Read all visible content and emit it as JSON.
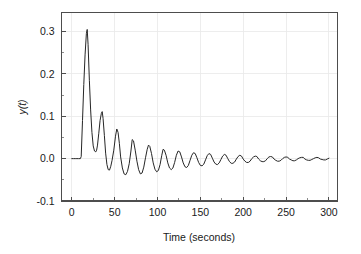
{
  "chart_data": {
    "type": "line",
    "title": "",
    "xlabel": "Time (seconds)",
    "ylabel": "y(t)",
    "xlim": [
      -12,
      310
    ],
    "ylim": [
      -0.1,
      0.345
    ],
    "xticks": [
      0,
      50,
      100,
      150,
      200,
      250,
      300
    ],
    "xtick_labels": [
      "0",
      "50",
      "100",
      "150",
      "200",
      "250",
      "300"
    ],
    "xminor_ticks": [
      25,
      75,
      125,
      175,
      225,
      275
    ],
    "yticks": [
      -0.1,
      0.0,
      0.1,
      0.2,
      0.3
    ],
    "ytick_labels": [
      "-0.1",
      "0.0",
      "0.1",
      "0.2",
      "0.3"
    ],
    "yminor_ticks": [
      -0.05,
      0.05,
      0.15,
      0.25
    ],
    "grid": true,
    "grid_color": "#e9e9e9",
    "line_color": "#262626",
    "legend": null,
    "series": [
      {
        "name": "y(t)",
        "x": [
          0,
          2,
          4,
          6,
          8,
          10,
          11,
          12.5,
          14,
          15.5,
          17,
          18,
          19,
          20.5,
          22,
          23.5,
          25,
          26.5,
          28,
          29,
          30,
          31.5,
          33,
          34.5,
          35.5,
          36.5,
          38,
          39.5,
          41,
          42.5,
          44,
          45.5,
          47,
          49,
          51,
          52.5,
          54,
          55.5,
          57,
          59,
          61,
          63,
          65,
          67,
          69,
          70.5,
          72,
          74,
          76,
          78,
          80,
          82,
          84,
          86,
          88,
          89.5,
          91,
          93,
          95,
          97,
          99,
          101,
          103,
          105,
          106.5,
          108,
          110,
          112,
          114,
          116,
          118,
          120,
          122,
          124,
          126,
          128,
          130,
          132,
          134,
          136,
          138,
          140,
          142,
          144,
          146,
          148,
          150,
          152,
          154,
          156,
          158,
          160,
          162,
          164,
          166,
          168,
          170,
          172,
          174,
          176,
          178,
          180,
          182,
          184,
          186,
          188,
          190,
          192,
          194,
          196,
          198,
          200,
          202,
          204,
          206,
          208,
          210,
          212,
          214,
          216,
          218,
          220,
          222,
          224,
          226,
          228,
          230,
          232,
          234,
          236,
          238,
          240,
          242,
          244,
          246,
          248,
          250,
          252,
          254,
          256,
          258,
          260,
          262,
          264,
          266,
          268,
          270,
          272,
          274,
          276,
          278,
          280,
          282,
          284,
          286,
          288,
          290,
          292,
          294,
          296,
          298,
          300
        ],
        "y": [
          0,
          0,
          0,
          0,
          0,
          0,
          0.005,
          0.09,
          0.175,
          0.245,
          0.295,
          0.305,
          0.27,
          0.185,
          0.115,
          0.062,
          0.03,
          0.018,
          0.016,
          0.02,
          0.032,
          0.06,
          0.09,
          0.107,
          0.111,
          0.095,
          0.055,
          0.013,
          -0.014,
          -0.026,
          -0.027,
          -0.018,
          -0.004,
          0.02,
          0.053,
          0.07,
          0.062,
          0.036,
          0.004,
          -0.022,
          -0.036,
          -0.038,
          -0.03,
          -0.012,
          0.018,
          0.045,
          0.042,
          0.02,
          -0.006,
          -0.026,
          -0.036,
          -0.034,
          -0.02,
          0.002,
          0.022,
          0.032,
          0.029,
          0.012,
          -0.01,
          -0.025,
          -0.031,
          -0.028,
          -0.014,
          0.008,
          0.022,
          0.02,
          0.008,
          -0.01,
          -0.022,
          -0.026,
          -0.022,
          -0.009,
          0.008,
          0.018,
          0.016,
          0.004,
          -0.01,
          -0.019,
          -0.021,
          -0.016,
          -0.004,
          0.008,
          0.014,
          0.012,
          0.002,
          -0.009,
          -0.016,
          -0.017,
          -0.013,
          -0.003,
          0.007,
          0.012,
          0.01,
          0.001,
          -0.008,
          -0.013,
          -0.014,
          -0.01,
          -0.002,
          0.006,
          0.01,
          0.008,
          0.0,
          -0.007,
          -0.011,
          -0.011,
          -0.008,
          -0.001,
          0.005,
          0.008,
          0.006,
          -0.001,
          -0.006,
          -0.009,
          -0.009,
          -0.006,
          0.0,
          0.004,
          0.006,
          0.005,
          -0.001,
          -0.005,
          -0.007,
          -0.007,
          -0.005,
          0.0,
          0.004,
          0.005,
          0.004,
          -0.001,
          -0.004,
          -0.006,
          -0.006,
          -0.004,
          0.0,
          0.003,
          0.004,
          0.003,
          -0.001,
          -0.003,
          -0.005,
          -0.005,
          -0.003,
          0.0,
          0.002,
          0.003,
          0.003,
          -0.001,
          -0.003,
          -0.004,
          -0.004,
          -0.002,
          0.0,
          0.002,
          0.003,
          0.002,
          -0.001,
          -0.002,
          -0.003,
          -0.003,
          -0.001,
          0.001
        ]
      }
    ]
  }
}
